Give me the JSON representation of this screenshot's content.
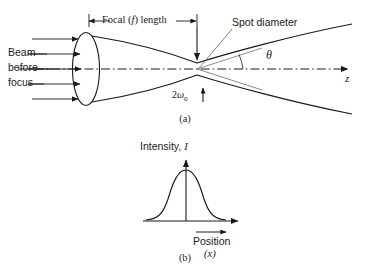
{
  "figure": {
    "background_color": "#ffffff",
    "ink_color": "#1a1a1a",
    "thin_ink_color": "#555555"
  },
  "panel_a": {
    "caption": "(a)",
    "focal_length_label_pre": "Focal (",
    "focal_length_label_var": "f",
    "focal_length_label_post": ") length",
    "spot_diameter_label": "Spot diameter",
    "beam_label_line1": "Beam",
    "beam_label_line2": "before",
    "beam_label_line3": "focus",
    "waist_label_prefix": "2",
    "waist_label_symbol": "ω",
    "waist_label_subscript": "0",
    "divergence_angle_label": "θ",
    "axis_label": "z",
    "incoming_ray_count": 5
  },
  "panel_b": {
    "caption": "(b)",
    "y_axis_label_text": "Intensity, ",
    "y_axis_label_var": "I",
    "x_axis_label_text": "Position",
    "x_axis_label_var": "(x)",
    "curve_type": "gaussian"
  }
}
